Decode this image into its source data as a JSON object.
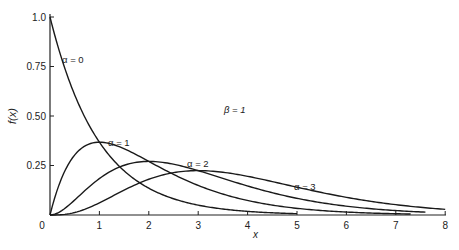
{
  "chart_data": {
    "type": "line",
    "title": "",
    "xlabel": "x",
    "ylabel": "f(x)",
    "xlim": [
      0,
      8
    ],
    "ylim": [
      0,
      1.0
    ],
    "x_ticks": [
      "0",
      "1",
      "2",
      "3",
      "4",
      "5",
      "6",
      "7",
      "8"
    ],
    "y_ticks": [
      "0.25",
      "0.50",
      "0.75",
      "1.0"
    ],
    "grid": false,
    "annotation": "β = 1",
    "series": [
      {
        "name": "α = 0",
        "x": [
          0,
          0.5,
          1,
          1.5,
          2,
          2.5,
          3,
          3.5,
          4,
          4.5,
          5
        ],
        "values": [
          1.0,
          0.607,
          0.368,
          0.223,
          0.135,
          0.082,
          0.05,
          0.03,
          0.018,
          0.011,
          0.007
        ]
      },
      {
        "name": "α = 1",
        "x": [
          0,
          0.5,
          1,
          1.5,
          2,
          2.5,
          3,
          3.5,
          4,
          5,
          6,
          7,
          7.3
        ],
        "values": [
          0,
          0.303,
          0.368,
          0.335,
          0.271,
          0.205,
          0.149,
          0.106,
          0.073,
          0.034,
          0.015,
          0.006,
          0.005
        ]
      },
      {
        "name": "α = 2",
        "x": [
          0,
          0.5,
          1,
          1.5,
          2,
          2.5,
          3,
          3.5,
          4,
          5,
          6,
          7,
          7.6
        ],
        "values": [
          0,
          0.076,
          0.184,
          0.251,
          0.271,
          0.257,
          0.224,
          0.185,
          0.147,
          0.084,
          0.045,
          0.022,
          0.014
        ]
      },
      {
        "name": "α = 3",
        "x": [
          0,
          0.5,
          1,
          1.5,
          2,
          2.5,
          3,
          3.5,
          4,
          5,
          6,
          7,
          8
        ],
        "values": [
          0,
          0.013,
          0.061,
          0.126,
          0.18,
          0.214,
          0.224,
          0.216,
          0.195,
          0.14,
          0.089,
          0.052,
          0.029
        ]
      }
    ],
    "labels": {
      "alpha0": "α = 0",
      "alpha1": "α = 1",
      "alpha2": "α = 2",
      "alpha3": "α = 3",
      "beta": "β = 1"
    }
  }
}
